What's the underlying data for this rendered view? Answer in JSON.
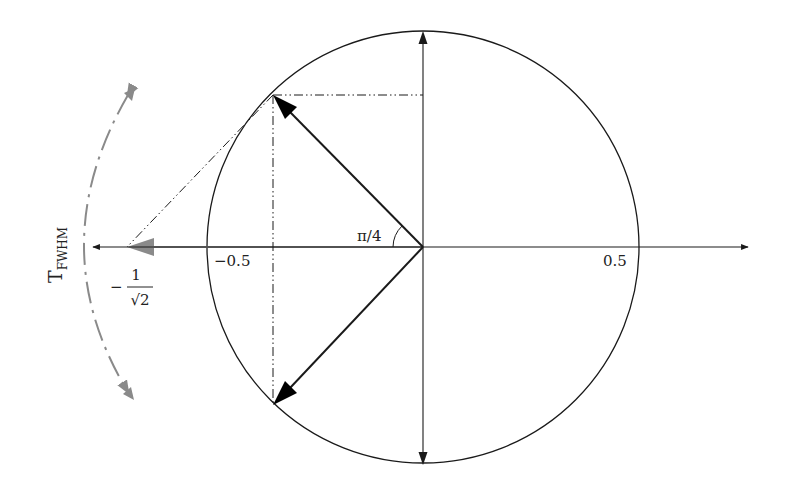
{
  "diagram": {
    "type": "phasor-diagram",
    "labels": {
      "angle": "π/4",
      "tick_neg": "−0.5",
      "tick_pos": "0.5",
      "tfwhm_main": "T",
      "tfwhm_sub": "FWHM",
      "frac_sign": "−",
      "frac_num": "1",
      "frac_den": "√2"
    },
    "colors": {
      "line": "#1a1a1a",
      "gray": "#8a8a8a",
      "background": "#ffffff"
    },
    "geometry": {
      "circle": {
        "cx": 423,
        "cy": 247,
        "r": 216
      },
      "upper_vector_tip": [
        273,
        95
      ],
      "lower_vector_tip": [
        273,
        405
      ],
      "projection_point": [
        127,
        247
      ]
    }
  }
}
